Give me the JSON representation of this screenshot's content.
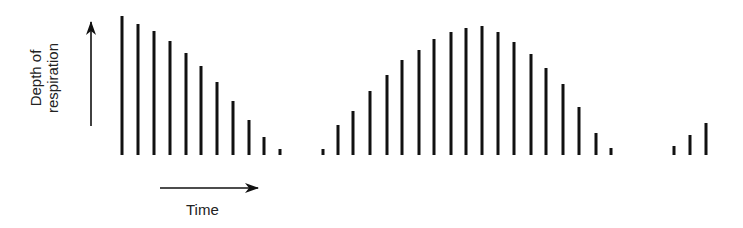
{
  "chart_data": {
    "type": "bar",
    "title": "",
    "xlabel": "Time",
    "ylabel": "Depth of respiration",
    "ylabel_lines": [
      "Depth of",
      "respiration"
    ],
    "grid": false,
    "legend": null,
    "baseline_y_px": 155,
    "bar_color": "#111111",
    "bars": [
      {
        "x": 122,
        "depth": 139
      },
      {
        "x": 138,
        "depth": 131
      },
      {
        "x": 154,
        "depth": 124
      },
      {
        "x": 170,
        "depth": 114
      },
      {
        "x": 186,
        "depth": 102
      },
      {
        "x": 201,
        "depth": 89
      },
      {
        "x": 217,
        "depth": 73
      },
      {
        "x": 233,
        "depth": 54
      },
      {
        "x": 249,
        "depth": 35
      },
      {
        "x": 264,
        "depth": 18
      },
      {
        "x": 280,
        "depth": 6
      },
      {
        "x": 323,
        "depth": 6
      },
      {
        "x": 338,
        "depth": 30
      },
      {
        "x": 353,
        "depth": 44
      },
      {
        "x": 370,
        "depth": 64
      },
      {
        "x": 387,
        "depth": 80
      },
      {
        "x": 402,
        "depth": 95
      },
      {
        "x": 419,
        "depth": 105
      },
      {
        "x": 434,
        "depth": 116
      },
      {
        "x": 451,
        "depth": 123
      },
      {
        "x": 466,
        "depth": 127
      },
      {
        "x": 482,
        "depth": 129
      },
      {
        "x": 498,
        "depth": 123
      },
      {
        "x": 514,
        "depth": 113
      },
      {
        "x": 531,
        "depth": 101
      },
      {
        "x": 546,
        "depth": 87
      },
      {
        "x": 563,
        "depth": 71
      },
      {
        "x": 579,
        "depth": 48
      },
      {
        "x": 596,
        "depth": 22
      },
      {
        "x": 611,
        "depth": 7
      },
      {
        "x": 674,
        "depth": 9
      },
      {
        "x": 690,
        "depth": 20
      },
      {
        "x": 706,
        "depth": 32
      }
    ]
  },
  "labels": {
    "ylabel_line1": "Depth of",
    "ylabel_line2": "respiration",
    "xlabel": "Time"
  }
}
